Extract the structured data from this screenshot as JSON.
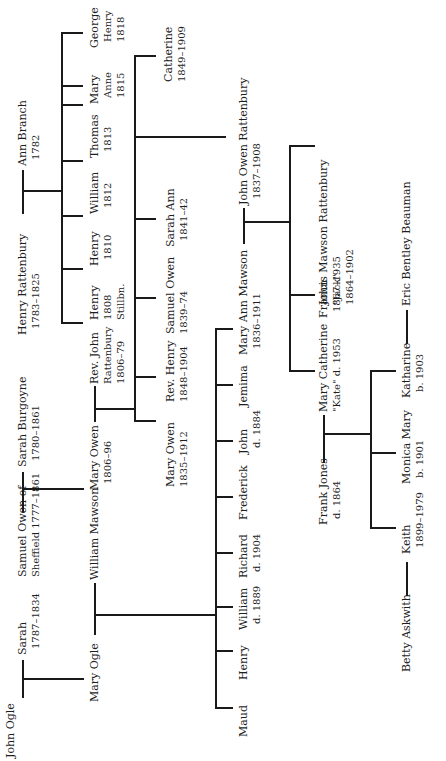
{
  "diagram": {
    "type": "family-tree",
    "orientation": "rotated-90-ccw",
    "line_color": "#1a1a1a",
    "text_color": "#1e1e1e"
  },
  "people": {
    "john_ogle": {
      "name": "John Ogle"
    },
    "sarah": {
      "name": "Sarah",
      "dates": "1787–1834"
    },
    "mary_ogle": {
      "name": "Mary Ogle"
    },
    "samuel_owen": {
      "name": "Samuel Owen of",
      "line2": "Sheffield 1777–1861"
    },
    "sarah_burgoyne": {
      "name": "Sarah Burgoyne",
      "dates": "1780–1861"
    },
    "william_mawson": {
      "name": "William Mawson"
    },
    "mary_owen_1806": {
      "name": "Mary Owen",
      "dates": "1806–96"
    },
    "henry_rattenbury": {
      "name": "Henry Rattenbury",
      "dates": "1783–1825"
    },
    "ann_branch": {
      "name": "Ann Branch",
      "dates": "1782"
    },
    "rev_john_rattenbury": {
      "name": "Rev. John",
      "line2": "Rattenbury",
      "dates": "1806–79"
    },
    "henry_1808": {
      "name": "Henry",
      "line2": "1808",
      "dates": "Stillbn."
    },
    "henry_1810": {
      "name": "Henry",
      "dates": "1810"
    },
    "william_1812": {
      "name": "William",
      "dates": "1812"
    },
    "thomas_1813": {
      "name": "Thomas",
      "dates": "1813"
    },
    "mary_anne_1815": {
      "name": "Mary",
      "line2": "Anne",
      "dates": "1815"
    },
    "george_henry_1818": {
      "name": "George",
      "line2": "Henry",
      "dates": "1818"
    },
    "mary_owen_1835": {
      "name": "Mary Owen",
      "dates": "1835–1912"
    },
    "rev_henry": {
      "name": "Rev. Henry",
      "dates": "1848–1904"
    },
    "samuel_owen_1839": {
      "name": "Samuel Owen",
      "dates": "1839–74"
    },
    "sarah_ann": {
      "name": "Sarah Ann",
      "dates": "1841–42"
    },
    "catherine": {
      "name": "Catherine",
      "dates": "1849–1909"
    },
    "maud": {
      "name": "Maud"
    },
    "henry_m": {
      "name": "Henry"
    },
    "william_m": {
      "name": "William",
      "dates": "d. 1889"
    },
    "richard": {
      "name": "Richard",
      "dates": "d. 1904"
    },
    "frederick": {
      "name": "Frederick"
    },
    "john_m": {
      "name": "John",
      "dates": "d. 1884"
    },
    "jemima": {
      "name": "Jemima"
    },
    "mary_ann_mawson": {
      "name": "Mary Ann Mawson",
      "dates": "1836–1911"
    },
    "john_owen_rattenbury": {
      "name": "John Owen Rattenbury",
      "dates": "1837–1908"
    },
    "frank_jones": {
      "name": "Frank Jones",
      "dates": "d. 1864"
    },
    "mary_catherine": {
      "name": "Mary Catherine",
      "dates": "\"Kate\" d. 1953"
    },
    "john_jack": {
      "name": "John",
      "line2": "\"Jack\"",
      "dates": "1864–1902"
    },
    "francis_mawson": {
      "name": "Francis Mawson Rattenbury",
      "dates": "1867–1935"
    },
    "keith": {
      "name": "Keith",
      "dates": "1899–1979"
    },
    "monica_mary": {
      "name": "Monica Mary",
      "dates": "b. 1901"
    },
    "katharine": {
      "name": "Katharine",
      "dates": "b. 1903"
    },
    "betty_askwith": {
      "name": "Betty Askwith"
    },
    "eric_beauman": {
      "name": "Eric Bentley Beauman"
    }
  },
  "marriages": [
    [
      "john_ogle",
      "sarah"
    ],
    [
      "samuel_owen",
      "sarah_burgoyne"
    ],
    [
      "henry_rattenbury",
      "ann_branch"
    ],
    [
      "mary_ogle",
      "william_mawson"
    ],
    [
      "mary_owen_1806",
      "rev_john_rattenbury"
    ],
    [
      "mary_ann_mawson",
      "john_owen_rattenbury"
    ],
    [
      "frank_jones",
      "mary_catherine"
    ],
    [
      "betty_askwith",
      "keith"
    ],
    [
      "katharine",
      "eric_beauman"
    ]
  ]
}
